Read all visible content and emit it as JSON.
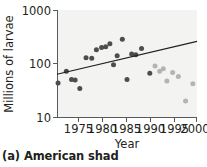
{
  "caption": "(a) American shad",
  "colors": {
    "point_early": "#4d4d50",
    "point_late": "#b4b4b2",
    "trend_line": "#231f20",
    "axis": "#58595b",
    "plot_background": "#f3f3f2",
    "text": "#231f20"
  },
  "chart_data": {
    "type": "scatter",
    "title": "",
    "xlabel": "Year",
    "ylabel": "Millions of larvae",
    "xlim": [
      1973,
      2000
    ],
    "ylim": [
      10,
      1000
    ],
    "yscale": "log",
    "xscale": "linear",
    "grid": false,
    "legend": "none",
    "xticks": [
      1975,
      1980,
      1985,
      1990,
      1995,
      2000
    ],
    "xtick_labels": [
      "1975",
      "1980",
      "1985",
      "1990",
      "1995",
      "2000"
    ],
    "yticks": [
      10,
      100,
      1000
    ],
    "ytick_labels": [
      "10",
      "100",
      "1000"
    ],
    "series": [
      {
        "name": "early-period",
        "color": "#4d4d50",
        "points": [
          {
            "x": 1973.2,
            "y": 43
          },
          {
            "x": 1974.8,
            "y": 72
          },
          {
            "x": 1975.8,
            "y": 50
          },
          {
            "x": 1976.5,
            "y": 49
          },
          {
            "x": 1977.4,
            "y": 34
          },
          {
            "x": 1978.6,
            "y": 128
          },
          {
            "x": 1979.7,
            "y": 125
          },
          {
            "x": 1980.6,
            "y": 180
          },
          {
            "x": 1981.6,
            "y": 200
          },
          {
            "x": 1982.4,
            "y": 205
          },
          {
            "x": 1983.2,
            "y": 235
          },
          {
            "x": 1983.9,
            "y": 95
          },
          {
            "x": 1984.6,
            "y": 140
          },
          {
            "x": 1985.6,
            "y": 285
          },
          {
            "x": 1986.5,
            "y": 50
          },
          {
            "x": 1987.4,
            "y": 150
          },
          {
            "x": 1988.2,
            "y": 145
          },
          {
            "x": 1989.3,
            "y": 190
          },
          {
            "x": 1990.9,
            "y": 66
          }
        ]
      },
      {
        "name": "late-period",
        "color": "#b4b4b2",
        "points": [
          {
            "x": 1991.9,
            "y": 90
          },
          {
            "x": 1992.8,
            "y": 72
          },
          {
            "x": 1993.5,
            "y": 80
          },
          {
            "x": 1994.2,
            "y": 47
          },
          {
            "x": 1995.3,
            "y": 68
          },
          {
            "x": 1996.4,
            "y": 57
          },
          {
            "x": 1997.8,
            "y": 20
          },
          {
            "x": 1999.2,
            "y": 42
          }
        ]
      }
    ],
    "trend_line": {
      "name": "regression-line",
      "x_start": 1973,
      "y_start": 63,
      "x_end": 2000,
      "y_end": 260
    }
  }
}
